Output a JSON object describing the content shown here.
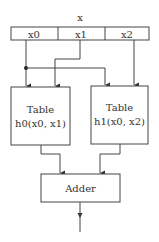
{
  "diagram": {
    "input_label": "x",
    "input_fields": [
      "x0",
      "x1",
      "x2"
    ],
    "tables": [
      {
        "title": "Table",
        "function": "h0(x0, x1)"
      },
      {
        "title": "Table",
        "function": "h1(x0, x2)"
      }
    ],
    "adder_label": "Adder",
    "colors": {
      "stroke": "#444444",
      "text": "#333333",
      "background": "#ffffff"
    }
  }
}
